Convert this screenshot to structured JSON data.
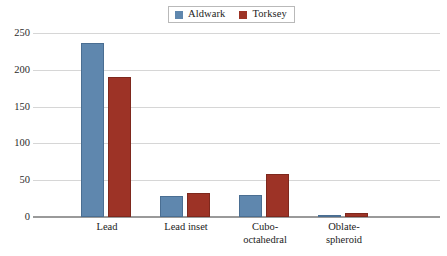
{
  "chart_data": {
    "type": "bar",
    "title": "",
    "subtitle": "",
    "xlabel": "",
    "ylabel": "",
    "categories": [
      "Lead",
      "Lead inset",
      "Cubo-\noctahedral",
      "Oblate-\nspheroid"
    ],
    "series": [
      {
        "name": "Aldwark",
        "color": "#5f87ae",
        "values": [
          237,
          28,
          30,
          3
        ]
      },
      {
        "name": "Torksey",
        "color": "#9d3326",
        "values": [
          190,
          33,
          59,
          5
        ]
      }
    ],
    "ylim": [
      0,
      250
    ],
    "yticks": [
      0,
      50,
      100,
      150,
      200,
      250
    ],
    "ytick_labels": [
      "0",
      "50",
      "100",
      "150",
      "200",
      "250"
    ],
    "grid": true,
    "legend_position": "top-center",
    "legend_entries": [
      "Aldwark",
      "Torksey"
    ]
  },
  "legend": {
    "entries": [
      {
        "label": "Aldwark",
        "color": "#5f87ae"
      },
      {
        "label": "Torksey",
        "color": "#9d3326"
      }
    ]
  },
  "axes": {
    "ytick_labels": [
      "250",
      "200",
      "150",
      "100",
      "50",
      "0"
    ],
    "category_labels": [
      "Lead",
      "Lead inset",
      "Cubo-\noctahedral",
      "Oblate-\nspheroid"
    ]
  },
  "colors": {
    "series_aldwark": "#5f87ae",
    "series_torksey": "#9d3326",
    "gridline": "#d6d6d6",
    "axis": "#9a9a9a",
    "background": "#ffffff",
    "text": "#1c1c1c"
  }
}
